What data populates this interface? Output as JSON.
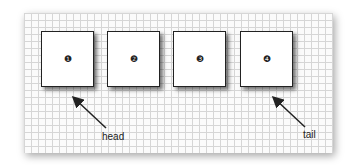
{
  "diagram": {
    "type": "linked-list",
    "nodes": [
      {
        "id": 1,
        "label": "❶",
        "x": 41
      },
      {
        "id": 2,
        "label": "❷",
        "x": 107
      },
      {
        "id": 3,
        "label": "❸",
        "x": 173
      },
      {
        "id": 4,
        "label": "❹",
        "x": 240
      }
    ],
    "pointers": [
      {
        "label": "head",
        "target_node": 1
      },
      {
        "label": "tail",
        "target_node": 4
      }
    ]
  }
}
